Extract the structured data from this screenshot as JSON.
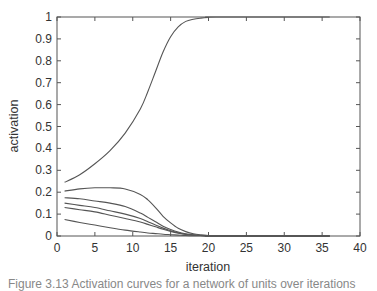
{
  "chart_data": {
    "type": "line",
    "title": "",
    "xlabel": "iteration",
    "ylabel": "activation",
    "xlim": [
      0,
      40
    ],
    "ylim": [
      0,
      1
    ],
    "xticks": [
      0,
      5,
      10,
      15,
      20,
      25,
      30,
      35,
      40
    ],
    "yticks": [
      0,
      0.1,
      0.2,
      0.3,
      0.4,
      0.5,
      0.6,
      0.7,
      0.8,
      0.9,
      1
    ],
    "ytick_labels": [
      "0",
      "0.1",
      "0.2",
      "0.3",
      "0.4",
      "0.5",
      "0.6",
      "0.7",
      "0.8",
      "0.9",
      "1"
    ],
    "grid": false,
    "legend": null,
    "x": [
      1,
      3,
      5,
      7,
      9,
      11,
      12,
      13,
      14,
      15,
      16,
      17,
      18,
      19,
      20,
      21
    ],
    "series": [
      {
        "name": "unit 1",
        "values": [
          0.245,
          0.28,
          0.33,
          0.39,
          0.47,
          0.58,
          0.66,
          0.75,
          0.84,
          0.91,
          0.955,
          0.98,
          0.99,
          0.995,
          0.998,
          1.0
        ]
      },
      {
        "name": "unit 2",
        "values": [
          0.205,
          0.215,
          0.22,
          0.22,
          0.215,
          0.19,
          0.165,
          0.13,
          0.09,
          0.06,
          0.035,
          0.02,
          0.01,
          0.005,
          0.002,
          0.0
        ]
      },
      {
        "name": "unit 3",
        "values": [
          0.175,
          0.17,
          0.16,
          0.15,
          0.135,
          0.105,
          0.085,
          0.065,
          0.045,
          0.03,
          0.018,
          0.01,
          0.005,
          0.002,
          0.001,
          0.0
        ]
      },
      {
        "name": "unit 4",
        "values": [
          0.15,
          0.14,
          0.13,
          0.115,
          0.1,
          0.08,
          0.065,
          0.05,
          0.036,
          0.024,
          0.015,
          0.008,
          0.004,
          0.002,
          0.001,
          0.0
        ]
      },
      {
        "name": "unit 5",
        "values": [
          0.13,
          0.12,
          0.11,
          0.095,
          0.08,
          0.064,
          0.053,
          0.042,
          0.031,
          0.021,
          0.013,
          0.007,
          0.004,
          0.002,
          0.001,
          0.0
        ]
      },
      {
        "name": "unit 6",
        "values": [
          0.075,
          0.062,
          0.05,
          0.038,
          0.027,
          0.018,
          0.014,
          0.011,
          0.008,
          0.006,
          0.004,
          0.002,
          0.001,
          0.001,
          0.0,
          0.0
        ]
      }
    ]
  },
  "caption": "Figure 3.13  Activation curves for a network of units over iterations"
}
